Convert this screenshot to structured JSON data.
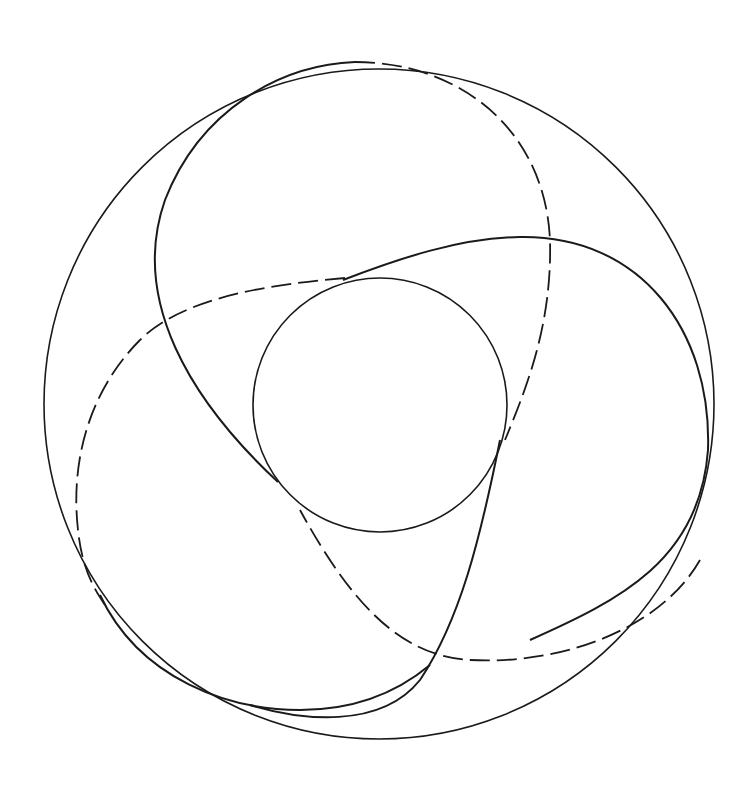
{
  "figure": {
    "stroke_color": "#1a1a1a",
    "background": "#ffffff",
    "outer_circle": {
      "cx": 379,
      "cy": 404,
      "r": 335,
      "stroke_width": 1.6
    },
    "inner_circle": {
      "cx": 380,
      "cy": 405,
      "r": 127,
      "stroke_width": 1.6
    },
    "loops": [
      {
        "name": "top-loop",
        "solid": "M 278 482 C 190 400, 130 300, 165 200 C 200 110, 280 65, 355 62",
        "dashed": "M 355 62 C 460 62, 545 130, 550 240 C 552 320, 530 380, 505 440"
      },
      {
        "name": "right-loop",
        "solid": "M 343 280 C 400 258, 460 238, 520 237 C 640 235, 712 330, 708 450 C 700 560, 620 600, 530 640",
        "solid2": "M 500 440 C 480 540, 460 620, 420 680 C 380 730, 300 720, 250 705",
        "dashed": "M 700 560 C 660 630, 560 665, 470 660 C 410 656, 360 620, 300 510"
      },
      {
        "name": "left-loop",
        "solid": "M 100 595 C 140 680, 230 710, 300 710 C 360 710, 400 690, 430 665",
        "dashed": "M 345 278 C 260 285, 180 300, 140 340 C 90 390, 70 460, 78 530 C 82 570, 95 590, 105 605"
      }
    ]
  }
}
